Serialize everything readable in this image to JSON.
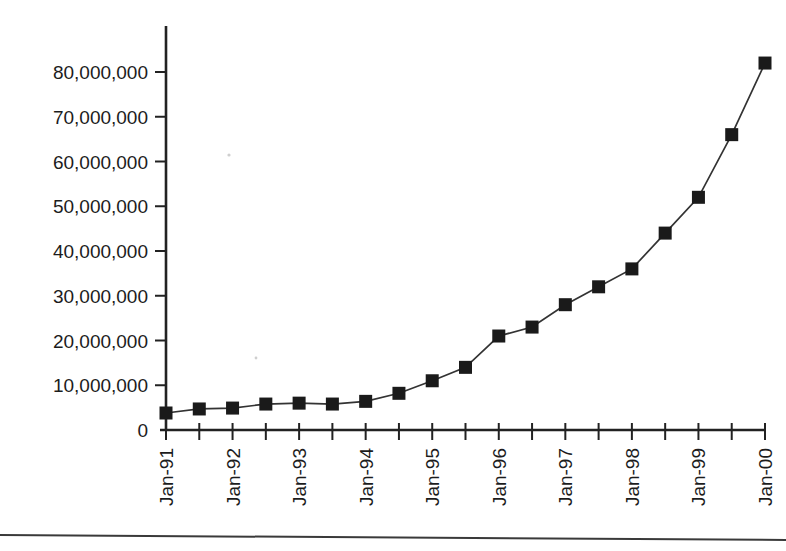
{
  "figure": {
    "name": "line-chart-exponential-growth",
    "background": "#ffffff",
    "ink_color": "#1a1a1a",
    "axis_color": "#222222",
    "width": 786,
    "height": 551
  },
  "chart_data": {
    "type": "line",
    "title": "",
    "subtitle": "",
    "xlabel": "",
    "ylabel": "",
    "grid": false,
    "legend": false,
    "marker": "filled-square",
    "line_color": "#333333",
    "marker_color": "#1a1a1a",
    "ylim": [
      0,
      88000000
    ],
    "ytick_values": [
      0,
      10000000,
      20000000,
      30000000,
      40000000,
      50000000,
      60000000,
      70000000,
      80000000
    ],
    "ytick_labels": [
      "0",
      "10,000,000",
      "20,000,000",
      "30,000,000",
      "40,000,000",
      "50,000,000",
      "60,000,000",
      "70,000,000",
      "80,000,000"
    ],
    "xtick_labels": [
      "Jan-91",
      "Jan-92",
      "Jan-93",
      "Jan-94",
      "Jan-95",
      "Jan-96",
      "Jan-97",
      "Jan-98",
      "Jan-99",
      "Jan-00"
    ],
    "xtick_label_rotation": -90,
    "x_minor_ticks_per_label": 2,
    "x": [
      "Jan-91",
      "Jul-91",
      "Jan-92",
      "Jul-92",
      "Jan-93",
      "Jul-93",
      "Jan-94",
      "Jul-94",
      "Jan-95",
      "Jul-95",
      "Jan-96",
      "Jul-96",
      "Jan-97",
      "Jul-97",
      "Jan-98",
      "Jul-98",
      "Jan-99",
      "Jul-99",
      "Jan-00"
    ],
    "values": [
      3800000,
      4700000,
      4900000,
      5800000,
      6000000,
      5800000,
      6400000,
      8200000,
      11000000,
      14000000,
      21000000,
      23000000,
      28000000,
      32000000,
      36000000,
      44000000,
      52000000,
      66000000,
      82000000
    ],
    "series": [
      {
        "name": "hosts",
        "values": [
          3800000,
          4700000,
          4900000,
          5800000,
          6000000,
          5800000,
          6400000,
          8200000,
          11000000,
          14000000,
          21000000,
          23000000,
          28000000,
          32000000,
          36000000,
          44000000,
          52000000,
          66000000,
          82000000
        ]
      }
    ]
  }
}
